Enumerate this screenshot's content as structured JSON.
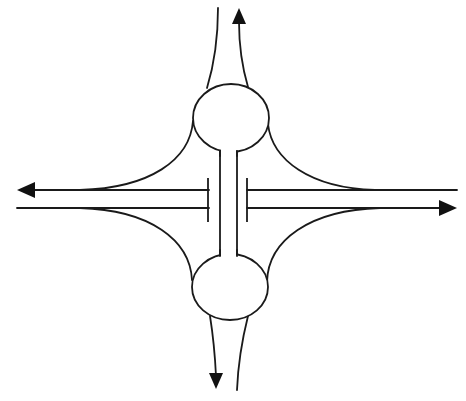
{
  "diagram": {
    "type": "road-interchange-schematic",
    "colors": {
      "line": "#1a1a1a",
      "arrow": "#111111",
      "background": "#ffffff"
    },
    "elements": {
      "roundabouts": [
        {
          "name": "north-roundabout",
          "cx": 231,
          "cy": 118,
          "rx": 38,
          "ry": 34
        },
        {
          "name": "south-roundabout",
          "cx": 230,
          "cy": 287,
          "rx": 38,
          "ry": 33
        }
      ],
      "connector": {
        "name": "overpass-link",
        "x_left": 220,
        "x_right": 237
      },
      "mainline": {
        "westbound": {
          "y": 190,
          "direction": "west"
        },
        "eastbound": {
          "y": 208,
          "direction": "east"
        }
      },
      "ramps": [
        "north-exit",
        "north-entry",
        "south-exit",
        "south-entry",
        "nw-ramp",
        "ne-ramp",
        "sw-ramp",
        "se-ramp"
      ],
      "arrows": [
        {
          "name": "north-arrow",
          "direction": "up"
        },
        {
          "name": "west-arrow",
          "direction": "left"
        },
        {
          "name": "east-arrow",
          "direction": "right"
        },
        {
          "name": "south-arrow",
          "direction": "down"
        }
      ]
    }
  }
}
